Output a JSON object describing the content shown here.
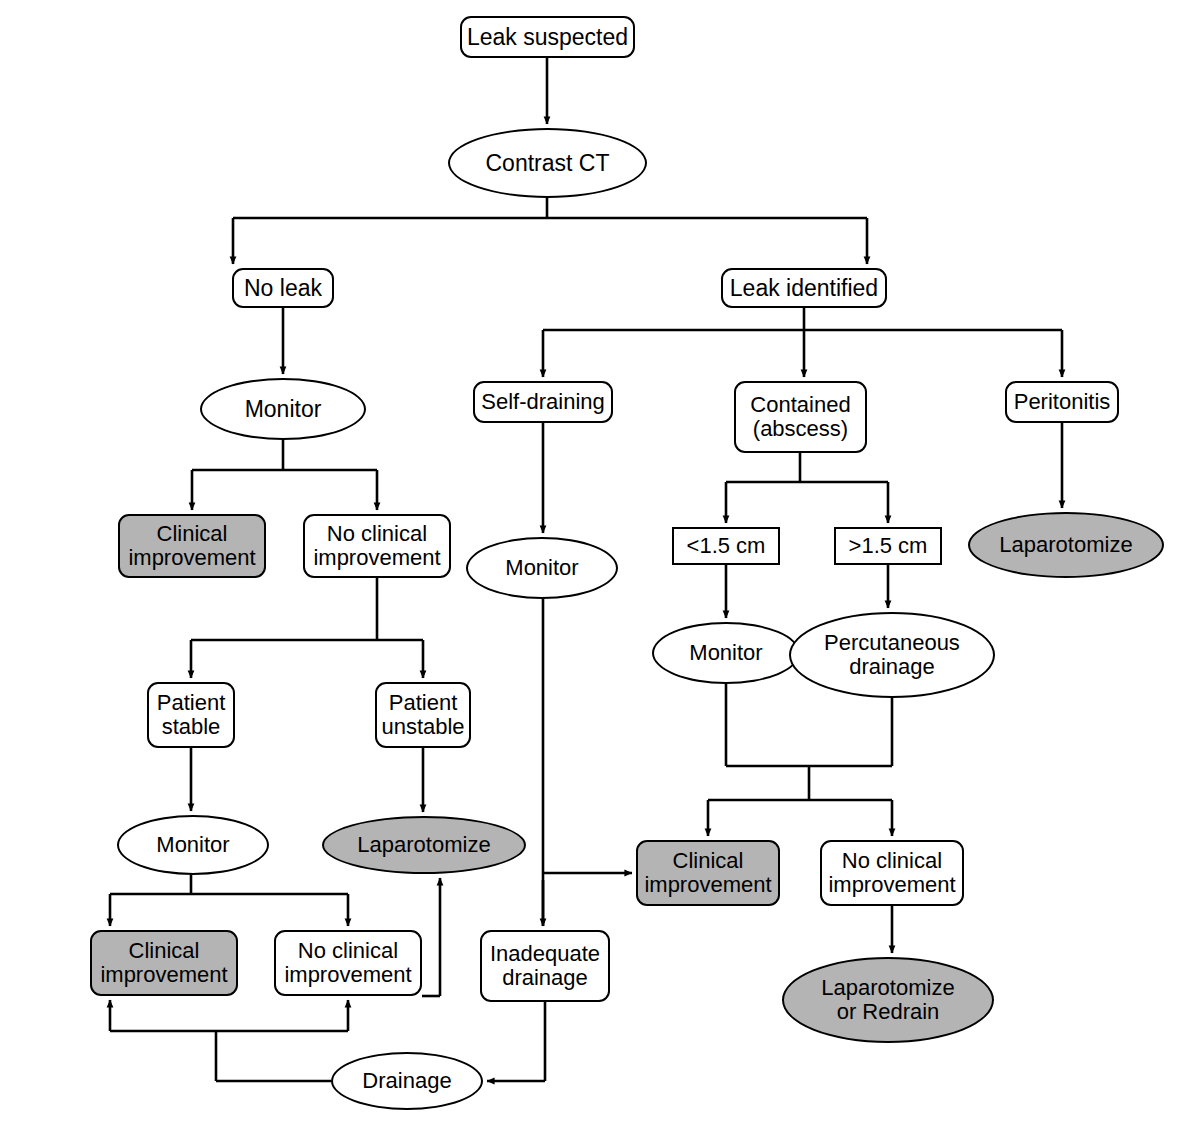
{
  "diagram": {
    "type": "clinical-decision-flowchart",
    "legend": {
      "shaded_meaning": "outcome / endpoint node",
      "shade_color": "#b4b4b4",
      "line_color": "#000000",
      "background": "#ffffff"
    },
    "nodes": [
      {
        "id": "leak_suspected",
        "label": "Leak suspected",
        "shape": "rounded-rect",
        "shaded": false,
        "x": 460,
        "y": 16,
        "w": 175,
        "h": 42,
        "font": 23
      },
      {
        "id": "contrast_ct",
        "label": "Contrast CT",
        "shape": "ellipse",
        "shaded": false,
        "x": 448,
        "y": 128,
        "w": 199,
        "h": 70,
        "font": 23
      },
      {
        "id": "no_leak",
        "label": "No leak",
        "shape": "rounded-rect",
        "shaded": false,
        "x": 232,
        "y": 268,
        "w": 102,
        "h": 40,
        "font": 23
      },
      {
        "id": "leak_identified",
        "label": "Leak identified",
        "shape": "rounded-rect",
        "shaded": false,
        "x": 721,
        "y": 268,
        "w": 166,
        "h": 40,
        "font": 23
      },
      {
        "id": "monitor_noleak",
        "label": "Monitor",
        "shape": "ellipse",
        "shaded": false,
        "x": 200,
        "y": 378,
        "w": 166,
        "h": 62,
        "font": 23
      },
      {
        "id": "self_draining",
        "label": "Self-draining",
        "shape": "rounded-rect",
        "shaded": false,
        "x": 473,
        "y": 381,
        "w": 140,
        "h": 42,
        "font": 22
      },
      {
        "id": "contained_abscess",
        "label": "Contained\n(abscess)",
        "shape": "rounded-rect",
        "shaded": false,
        "x": 734,
        "y": 381,
        "w": 133,
        "h": 72,
        "font": 22
      },
      {
        "id": "peritonitis",
        "label": "Peritonitis",
        "shape": "rounded-rect",
        "shaded": false,
        "x": 1005,
        "y": 381,
        "w": 114,
        "h": 42,
        "font": 22
      },
      {
        "id": "clin_imp_1",
        "label": "Clinical\nimprovement",
        "shape": "rounded-rect",
        "shaded": true,
        "x": 118,
        "y": 514,
        "w": 148,
        "h": 64,
        "font": 22
      },
      {
        "id": "no_clin_imp_1",
        "label": "No clinical\nimprovement",
        "shape": "rounded-rect",
        "shaded": false,
        "x": 303,
        "y": 514,
        "w": 148,
        "h": 64,
        "font": 22
      },
      {
        "id": "monitor_selfdrain",
        "label": "Monitor",
        "shape": "ellipse",
        "shaded": false,
        "x": 466,
        "y": 537,
        "w": 152,
        "h": 62,
        "font": 22
      },
      {
        "id": "lt_1_5cm",
        "label": "<1.5 cm",
        "shape": "sharp-rect",
        "shaded": false,
        "x": 672,
        "y": 527,
        "w": 108,
        "h": 38,
        "font": 22
      },
      {
        "id": "gt_1_5cm",
        "label": ">1.5 cm",
        "shape": "sharp-rect",
        "shaded": false,
        "x": 834,
        "y": 527,
        "w": 108,
        "h": 38,
        "font": 22
      },
      {
        "id": "laparotomize_perit",
        "label": "Laparotomize",
        "shape": "ellipse",
        "shaded": true,
        "x": 968,
        "y": 512,
        "w": 196,
        "h": 66,
        "font": 22
      },
      {
        "id": "patient_stable",
        "label": "Patient\nstable",
        "shape": "rounded-rect",
        "shaded": false,
        "x": 147,
        "y": 682,
        "w": 88,
        "h": 66,
        "font": 22
      },
      {
        "id": "patient_unstable",
        "label": "Patient\nunstable",
        "shape": "rounded-rect",
        "shaded": false,
        "x": 375,
        "y": 682,
        "w": 96,
        "h": 66,
        "font": 22
      },
      {
        "id": "monitor_abscess",
        "label": "Monitor",
        "shape": "ellipse",
        "shaded": false,
        "x": 652,
        "y": 622,
        "w": 148,
        "h": 62,
        "font": 22
      },
      {
        "id": "perc_drainage",
        "label": "Percutaneous\ndrainage",
        "shape": "ellipse",
        "shaded": false,
        "x": 789,
        "y": 612,
        "w": 206,
        "h": 86,
        "font": 22
      },
      {
        "id": "monitor_stable",
        "label": "Monitor",
        "shape": "ellipse",
        "shaded": false,
        "x": 117,
        "y": 815,
        "w": 152,
        "h": 60,
        "font": 22
      },
      {
        "id": "laparotomize_unst",
        "label": "Laparotomize",
        "shape": "ellipse",
        "shaded": true,
        "x": 322,
        "y": 816,
        "w": 204,
        "h": 58,
        "font": 22
      },
      {
        "id": "clin_imp_2",
        "label": "Clinical\nimprovement",
        "shape": "rounded-rect",
        "shaded": true,
        "x": 636,
        "y": 840,
        "w": 144,
        "h": 66,
        "font": 22
      },
      {
        "id": "no_clin_imp_2",
        "label": "No clinical\nimprovement",
        "shape": "rounded-rect",
        "shaded": false,
        "x": 820,
        "y": 840,
        "w": 144,
        "h": 66,
        "font": 22
      },
      {
        "id": "clin_imp_3",
        "label": "Clinical\nimprovement",
        "shape": "rounded-rect",
        "shaded": true,
        "x": 90,
        "y": 930,
        "w": 148,
        "h": 66,
        "font": 22
      },
      {
        "id": "no_clin_imp_3",
        "label": "No clinical\nimprovement",
        "shape": "rounded-rect",
        "shaded": false,
        "x": 274,
        "y": 930,
        "w": 148,
        "h": 66,
        "font": 22
      },
      {
        "id": "inadequate_drainage",
        "label": "Inadequate\ndrainage",
        "shape": "rounded-rect",
        "shaded": false,
        "x": 480,
        "y": 930,
        "w": 130,
        "h": 72,
        "font": 22
      },
      {
        "id": "laparotomize_redrain",
        "label": "Laparotomize\nor Redrain",
        "shape": "ellipse",
        "shaded": true,
        "x": 782,
        "y": 957,
        "w": 212,
        "h": 86,
        "font": 22
      },
      {
        "id": "drainage",
        "label": "Drainage",
        "shape": "ellipse",
        "shaded": false,
        "x": 331,
        "y": 1052,
        "w": 152,
        "h": 58,
        "font": 22
      }
    ],
    "edges": [
      {
        "from": "leak_suspected",
        "to": "contrast_ct",
        "style": "straight-down"
      },
      {
        "from": "contrast_ct",
        "to": "no_leak",
        "style": "split-left"
      },
      {
        "from": "contrast_ct",
        "to": "leak_identified",
        "style": "split-right"
      },
      {
        "from": "no_leak",
        "to": "monitor_noleak",
        "style": "straight-down"
      },
      {
        "from": "leak_identified",
        "to": "self_draining",
        "style": "split-left"
      },
      {
        "from": "leak_identified",
        "to": "contained_abscess",
        "style": "straight-down"
      },
      {
        "from": "leak_identified",
        "to": "peritonitis",
        "style": "split-right"
      },
      {
        "from": "monitor_noleak",
        "to": "clin_imp_1",
        "style": "split-left"
      },
      {
        "from": "monitor_noleak",
        "to": "no_clin_imp_1",
        "style": "split-right"
      },
      {
        "from": "self_draining",
        "to": "monitor_selfdrain",
        "style": "straight-down"
      },
      {
        "from": "contained_abscess",
        "to": "lt_1_5cm",
        "style": "split-left"
      },
      {
        "from": "contained_abscess",
        "to": "gt_1_5cm",
        "style": "split-right"
      },
      {
        "from": "peritonitis",
        "to": "laparotomize_perit",
        "style": "straight-down"
      },
      {
        "from": "no_clin_imp_1",
        "to": "patient_stable",
        "style": "split-left"
      },
      {
        "from": "no_clin_imp_1",
        "to": "patient_unstable",
        "style": "split-right"
      },
      {
        "from": "lt_1_5cm",
        "to": "monitor_abscess",
        "style": "straight-down"
      },
      {
        "from": "gt_1_5cm",
        "to": "perc_drainage",
        "style": "straight-down"
      },
      {
        "from": "patient_stable",
        "to": "monitor_stable",
        "style": "straight-down"
      },
      {
        "from": "patient_unstable",
        "to": "laparotomize_unst",
        "style": "straight-down"
      },
      {
        "from": "monitor_abscess",
        "to": "clin_imp_2",
        "style": "merge-split"
      },
      {
        "from": "perc_drainage",
        "to": "no_clin_imp_2",
        "style": "merge-split"
      },
      {
        "from": "monitor_selfdrain",
        "to": "clin_imp_2",
        "style": "right-arrow"
      },
      {
        "from": "monitor_selfdrain",
        "to": "inadequate_drainage",
        "style": "straight-down"
      },
      {
        "from": "monitor_stable",
        "to": "clin_imp_3",
        "style": "split-left"
      },
      {
        "from": "monitor_stable",
        "to": "no_clin_imp_3",
        "style": "split-right"
      },
      {
        "from": "no_clin_imp_2",
        "to": "laparotomize_redrain",
        "style": "straight-down"
      },
      {
        "from": "no_clin_imp_3",
        "to": "laparotomize_unst",
        "style": "up-right-loop"
      },
      {
        "from": "inadequate_drainage",
        "to": "drainage",
        "style": "down-left-arrow"
      },
      {
        "from": "drainage",
        "to": "clin_imp_3",
        "style": "loop-up-left"
      },
      {
        "from": "drainage",
        "to": "no_clin_imp_3",
        "style": "loop-up-left"
      }
    ]
  }
}
